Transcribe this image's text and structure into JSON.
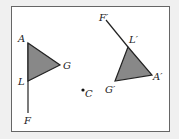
{
  "diagram": {
    "type": "geometric-transformation",
    "frame": {
      "x": 11,
      "y": 6,
      "width": 159,
      "height": 126
    },
    "colors": {
      "background": "#f0f0f0",
      "frame_fill": "#ffffff",
      "frame_stroke": "#666666",
      "triangle_fill": "#888888",
      "line": "#222222"
    },
    "original": {
      "points": {
        "A": {
          "label": "A",
          "x": 28,
          "y": 43
        },
        "G": {
          "label": "G",
          "x": 60,
          "y": 65
        },
        "L": {
          "label": "L",
          "x": 28,
          "y": 81
        },
        "F": {
          "label": "F",
          "x": 28,
          "y": 113
        }
      }
    },
    "image": {
      "points": {
        "F": {
          "label": "F′",
          "x": 106,
          "y": 20
        },
        "L": {
          "label": "L′",
          "x": 128,
          "y": 47
        },
        "A": {
          "label": "A′",
          "x": 152,
          "y": 75
        },
        "G": {
          "label": "G′",
          "x": 115,
          "y": 81
        }
      }
    },
    "center": {
      "label": "C",
      "x": 83,
      "y": 90
    }
  }
}
